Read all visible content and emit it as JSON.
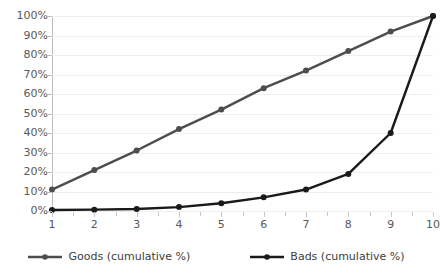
{
  "chart_data": {
    "type": "line",
    "title": "",
    "subtitle": "",
    "xlabel": "",
    "ylabel": "",
    "x": [
      1,
      2,
      3,
      4,
      5,
      6,
      7,
      8,
      9,
      10
    ],
    "xtick_labels": [
      "1",
      "2",
      "3",
      "4",
      "5",
      "6",
      "7",
      "8",
      "9",
      "10"
    ],
    "ytick_labels": [
      "100%",
      "90%",
      "80%",
      "70%",
      "60%",
      "50%",
      "40%",
      "30%",
      "20%",
      "10%",
      "0%"
    ],
    "ytick_values": [
      100,
      90,
      80,
      70,
      60,
      50,
      40,
      30,
      20,
      10,
      0
    ],
    "ylim": [
      0,
      100
    ],
    "xlim": [
      1,
      10
    ],
    "grid": true,
    "legend_position": "bottom",
    "series": [
      {
        "name": "Goods (cumulative %)",
        "color": "#4d4d4d",
        "marker": "circle",
        "values": [
          11,
          21,
          31,
          42,
          52,
          63,
          72,
          82,
          92,
          100
        ]
      },
      {
        "name": "Bads (cumulative %)",
        "color": "#1a1a1a",
        "marker": "circle",
        "values": [
          0.5,
          0.7,
          1,
          2,
          4,
          7,
          11,
          19,
          40,
          100
        ]
      }
    ]
  },
  "legend": {
    "items": [
      {
        "label": "Goods (cumulative %)"
      },
      {
        "label": "Bads (cumulative %)"
      }
    ]
  },
  "colors": {
    "goods": "#4d4d4d",
    "bads": "#1a1a1a",
    "gridline": "#eceff1",
    "axis": "#b8bcc0",
    "tick_text": "#595959"
  }
}
